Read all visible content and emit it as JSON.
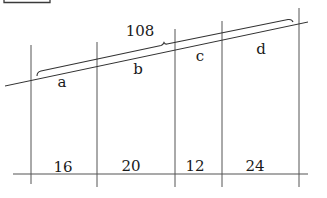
{
  "diagram": {
    "type": "parallel-lines-transversals",
    "top_box": {
      "visible": true,
      "partial": true
    },
    "total_label": "108",
    "top_segments": [
      {
        "name": "a",
        "label": "a"
      },
      {
        "name": "b",
        "label": "b"
      },
      {
        "name": "c",
        "label": "c"
      },
      {
        "name": "d",
        "label": "d"
      }
    ],
    "bottom_segments": [
      {
        "label": "16"
      },
      {
        "label": "20"
      },
      {
        "label": "12"
      },
      {
        "label": "24"
      }
    ],
    "colors": {
      "line": "#3a3a3a",
      "text": "#1a1a1a",
      "background": "#ffffff"
    }
  }
}
